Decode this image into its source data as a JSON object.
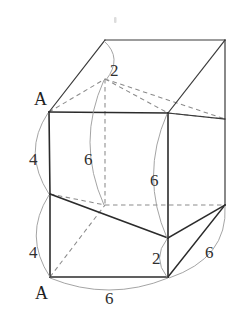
{
  "figure": {
    "type": "3d-geometry-diagram",
    "canvas": {
      "width": 239,
      "height": 316
    },
    "colors": {
      "background": "#ffffff",
      "solid_edge": "#2b2b2b",
      "hidden_edge": "#8b8b8b",
      "arc": "#9a9a9a",
      "text": "#2f2f2f"
    },
    "vertex_labels": [
      {
        "name": "vertex-label-a-top",
        "text": "A",
        "x": 34,
        "y": 105
      },
      {
        "name": "vertex-label-a-bottom",
        "text": "A",
        "x": 35,
        "y": 299
      }
    ],
    "dimension_labels": [
      {
        "name": "dim-top-2",
        "text": "2",
        "x": 110,
        "y": 76
      },
      {
        "name": "dim-left-upper-4",
        "text": "4",
        "x": 29,
        "y": 165
      },
      {
        "name": "dim-center-6",
        "text": "6",
        "x": 84,
        "y": 165
      },
      {
        "name": "dim-right-6",
        "text": "6",
        "x": 150,
        "y": 186
      },
      {
        "name": "dim-left-lower-4",
        "text": "4",
        "x": 29,
        "y": 258
      },
      {
        "name": "dim-bottom-right-2",
        "text": "2",
        "x": 152,
        "y": 264
      },
      {
        "name": "dim-far-right-6",
        "text": "6",
        "x": 205,
        "y": 258
      },
      {
        "name": "dim-bottom-6",
        "text": "6",
        "x": 105,
        "y": 304
      }
    ],
    "geometry": {
      "front_top_left": [
        49,
        112
      ],
      "front_top_right": [
        168,
        113
      ],
      "front_mid_left": [
        50,
        194
      ],
      "front_mid_right": [
        168,
        238
      ],
      "front_bottom_left": [
        50,
        277
      ],
      "front_bottom_right": [
        168,
        277
      ],
      "top_apex_left": [
        105,
        40
      ],
      "top_apex_right": [
        225,
        40
      ],
      "back_top_left": [
        105,
        79
      ],
      "back_bottom_left": [
        105,
        205
      ],
      "back_right_upper": [
        225,
        119
      ],
      "back_right_lower": [
        225,
        205
      ]
    }
  }
}
